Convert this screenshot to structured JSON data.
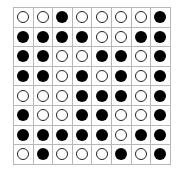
{
  "board": {
    "rows": 8,
    "cols": 8,
    "colors": {
      "filled": "#000000",
      "hollow": "#ffffff",
      "grid_line": "#b8b8b8"
    },
    "cells": [
      [
        0,
        0,
        1,
        0,
        0,
        0,
        0,
        1
      ],
      [
        1,
        1,
        1,
        1,
        0,
        0,
        1,
        1
      ],
      [
        1,
        1,
        0,
        0,
        1,
        1,
        0,
        1
      ],
      [
        1,
        1,
        0,
        1,
        0,
        1,
        0,
        1
      ],
      [
        0,
        0,
        0,
        1,
        1,
        1,
        0,
        1
      ],
      [
        1,
        0,
        0,
        1,
        1,
        0,
        0,
        1
      ],
      [
        1,
        1,
        1,
        1,
        1,
        0,
        1,
        1
      ],
      [
        0,
        1,
        0,
        0,
        0,
        1,
        0,
        1
      ]
    ]
  }
}
